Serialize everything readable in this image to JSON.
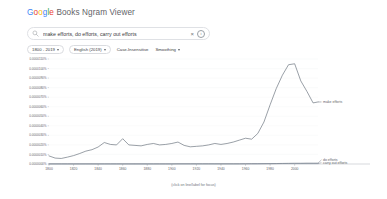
{
  "header": {
    "title_google": "Google",
    "title_rest": " Books Ngram Viewer",
    "logo_letters": [
      "G",
      "o",
      "o",
      "g",
      "l",
      "e"
    ]
  },
  "search": {
    "value": "make efforts, do efforts, carry out efforts",
    "placeholder": "Search in Google Books Ngram Viewer",
    "search_icon": "search-icon",
    "clear_icon": "close-icon",
    "clear_glyph": "×",
    "info_icon": "info-icon",
    "info_glyph": "i"
  },
  "filters": [
    {
      "label": "1800 - 2019",
      "has_caret": true,
      "name": "date-range-chip"
    },
    {
      "label": "English (2019)",
      "has_caret": true,
      "name": "corpus-chip"
    },
    {
      "label": "Case-Insensitive",
      "has_caret": false,
      "name": "case-insensitive-chip"
    },
    {
      "label": "Smoothing",
      "has_caret": true,
      "name": "smoothing-chip"
    }
  ],
  "footnote": "(click on line/label for focus)",
  "colors": {
    "line_make_efforts": "#5b6570",
    "line_do_efforts": "#6b7280",
    "line_carry_out_efforts": "#7a8592",
    "grid": "#f1f3f4",
    "axis": "#9aa0a6",
    "text": "#5f6368"
  },
  "chart_data": {
    "type": "line",
    "title": "",
    "xlabel": "",
    "ylabel": "",
    "xlim": [
      1800,
      2019
    ],
    "ylim": [
      0.0,
      1.1e-05
    ],
    "grid": true,
    "legend_position": "right-inline",
    "ytick_labels": [
      "0.0000110%",
      "0.0000100%",
      "0.0000090%",
      "0.0000080%",
      "0.0000070%",
      "0.0000060%",
      "0.0000050%",
      "0.0000040%",
      "0.0000030%",
      "0.0000020%",
      "0.0000010%",
      "0.0000000%"
    ],
    "ytick_values": [
      1.1e-05,
      1e-05,
      9e-06,
      8e-06,
      7e-06,
      6e-06,
      5e-06,
      4e-06,
      3e-06,
      2e-06,
      1e-06,
      0.0
    ],
    "xtick_labels": [
      "1800",
      "1820",
      "1840",
      "1860",
      "1880",
      "1900",
      "1920",
      "1940",
      "1960",
      "1980",
      "2000"
    ],
    "xtick_values": [
      1800,
      1820,
      1840,
      1860,
      1880,
      1900,
      1920,
      1940,
      1960,
      1980,
      2000
    ],
    "x": [
      1800,
      1805,
      1810,
      1815,
      1820,
      1825,
      1830,
      1835,
      1840,
      1845,
      1850,
      1855,
      1860,
      1865,
      1870,
      1875,
      1880,
      1885,
      1890,
      1895,
      1900,
      1905,
      1910,
      1915,
      1920,
      1925,
      1930,
      1935,
      1940,
      1945,
      1950,
      1955,
      1960,
      1965,
      1970,
      1975,
      1980,
      1985,
      1990,
      1995,
      2000,
      2005,
      2010,
      2015,
      2019
    ],
    "series": [
      {
        "name": "make efforts",
        "label": "make efforts",
        "color": "#5b6570",
        "values": [
          8.5e-07,
          6.2e-07,
          5.8e-07,
          7.2e-07,
          8.8e-07,
          1.1e-06,
          1.35e-06,
          1.5e-06,
          1.78e-06,
          2.25e-06,
          2.05e-06,
          2e-06,
          2.65e-06,
          2e-06,
          1.95e-06,
          1.9e-06,
          2.05e-06,
          2.15e-06,
          2e-06,
          2.05e-06,
          2.15e-06,
          2.3e-06,
          1.95e-06,
          1.8e-06,
          1.85e-06,
          1.9e-06,
          2e-06,
          2.15e-06,
          2.05e-06,
          2.15e-06,
          2.3e-06,
          2.5e-06,
          2.7e-06,
          2.6e-06,
          3.2e-06,
          4.4e-06,
          6.2e-06,
          7.9e-06,
          9.3e-06,
          1.04e-05,
          1.05e-05,
          8.7e-06,
          7.6e-06,
          6.4e-06,
          6.5e-06
        ]
      },
      {
        "name": "do efforts",
        "label": "do efforts",
        "color": "#6b7280",
        "values": [
          2e-08,
          2e-08,
          2e-08,
          2e-08,
          2e-08,
          2e-08,
          2e-08,
          2e-08,
          2e-08,
          2e-08,
          2e-08,
          2e-08,
          2e-08,
          2e-08,
          2e-08,
          2e-08,
          2e-08,
          2e-08,
          2e-08,
          2e-08,
          2e-08,
          2e-08,
          2e-08,
          2e-08,
          2e-08,
          2e-08,
          2e-08,
          2e-08,
          2e-08,
          2e-08,
          2e-08,
          2e-08,
          3e-08,
          3e-08,
          3e-08,
          4e-08,
          4e-08,
          5e-08,
          6e-08,
          7e-08,
          8e-08,
          8e-08,
          9e-08,
          9e-08,
          9e-08
        ]
      },
      {
        "name": "carry out efforts",
        "label": "carry out efforts",
        "color": "#7a8592",
        "values": [
          0.0,
          0.0,
          0.0,
          0.0,
          0.0,
          0.0,
          0.0,
          0.0,
          0.0,
          0.0,
          0.0,
          0.0,
          0.0,
          0.0,
          0.0,
          0.0,
          0.0,
          0.0,
          0.0,
          0.0,
          0.0,
          1e-08,
          1e-08,
          1e-08,
          1e-08,
          1e-08,
          1e-08,
          1e-08,
          1e-08,
          1e-08,
          1e-08,
          1e-08,
          1e-08,
          2e-08,
          2e-08,
          2e-08,
          3e-08,
          3e-08,
          4e-08,
          4e-08,
          4e-08,
          4e-08,
          4e-08,
          4e-08,
          4e-08
        ]
      }
    ]
  }
}
